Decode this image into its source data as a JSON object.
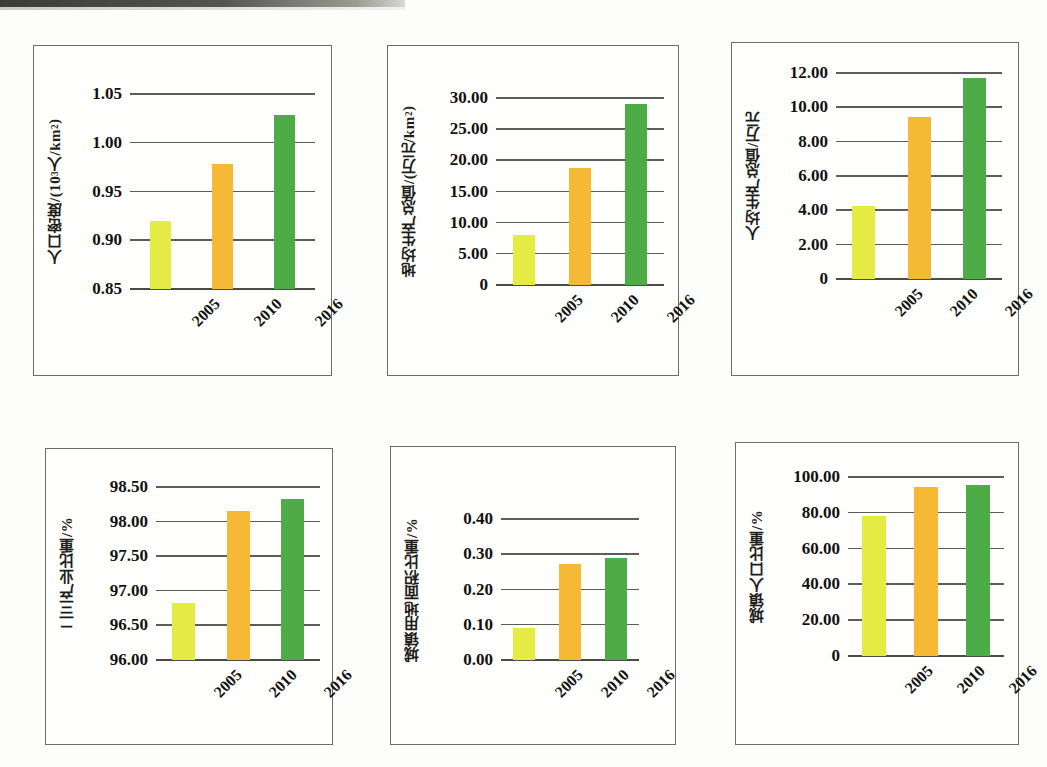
{
  "page": {
    "background_color": "#fdfdfb",
    "panel_border_color": "#6d6e60",
    "gridline_color": "#5d5d57",
    "series_colors": [
      "#e4ec44",
      "#f6b936",
      "#4dac46"
    ]
  },
  "charts": [
    {
      "id": "population-density",
      "chart_data": {
        "type": "bar",
        "title": "",
        "ylabel": "人口密度/(10³人/km²)",
        "ylabel_parts": {
          "pre": "人口密度/(10",
          "sup": "3",
          "post": "人/km",
          "sup2": "2",
          "tail": ")"
        },
        "xlabel": "",
        "categories": [
          "2005",
          "2010",
          "2016"
        ],
        "values": [
          0.92,
          0.978,
          1.028
        ],
        "ylim": [
          0.85,
          1.05
        ],
        "yticks": [
          0.85,
          0.9,
          0.95,
          1.0,
          1.05
        ],
        "ytick_labels": [
          "0.85",
          "0.90",
          "0.95",
          "1.00",
          "1.05"
        ],
        "grid": true,
        "legend": "none"
      }
    },
    {
      "id": "gdp-per-land-area",
      "chart_data": {
        "type": "bar",
        "title": "",
        "ylabel": "地均生产总值/(万元/km²)",
        "ylabel_parts": {
          "pre": "地均生产总值/(万元/km",
          "sup": "2",
          "post": ")"
        },
        "xlabel": "",
        "categories": [
          "2005",
          "2010",
          "2016"
        ],
        "values": [
          8.0,
          18.8,
          29.1
        ],
        "ylim": [
          0,
          30
        ],
        "yticks": [
          0,
          5,
          10,
          15,
          20,
          25,
          30
        ],
        "ytick_labels": [
          "0",
          "5.00",
          "10.00",
          "15.00",
          "20.00",
          "25.00",
          "30.00"
        ],
        "grid": true,
        "legend": "none"
      }
    },
    {
      "id": "gdp-per-capita",
      "chart_data": {
        "type": "bar",
        "title": "",
        "ylabel": "人均生产总值/万元",
        "xlabel": "",
        "categories": [
          "2005",
          "2010",
          "2016"
        ],
        "values": [
          4.25,
          9.45,
          11.7
        ],
        "ylim": [
          0,
          12
        ],
        "yticks": [
          0,
          2,
          4,
          6,
          8,
          10,
          12
        ],
        "ytick_labels": [
          "0",
          "2.00",
          "4.00",
          "6.00",
          "8.00",
          "10.00",
          "12.00"
        ],
        "grid": true,
        "legend": "none"
      }
    },
    {
      "id": "secondary-tertiary-industry-share",
      "chart_data": {
        "type": "bar",
        "title": "",
        "ylabel": "二三产业比重/%",
        "xlabel": "",
        "categories": [
          "2005",
          "2010",
          "2016"
        ],
        "values": [
          96.83,
          98.15,
          98.33
        ],
        "ylim": [
          96.0,
          98.5
        ],
        "yticks": [
          96.0,
          96.5,
          97.0,
          97.5,
          98.0,
          98.5
        ],
        "ytick_labels": [
          "96.00",
          "96.50",
          "97.00",
          "97.50",
          "98.00",
          "98.50"
        ],
        "grid": true,
        "legend": "none"
      }
    },
    {
      "id": "urban-land-area-share",
      "chart_data": {
        "type": "bar",
        "title": "",
        "ylabel": "城镇用地面积比重/%",
        "xlabel": "",
        "categories": [
          "2005",
          "2010",
          "2016"
        ],
        "values": [
          0.09,
          0.272,
          0.29
        ],
        "ylim": [
          0,
          0.4
        ],
        "yticks": [
          0,
          0.1,
          0.2,
          0.3,
          0.4
        ],
        "ytick_labels": [
          "0.00",
          "0.10",
          "0.20",
          "0.30",
          "0.40"
        ],
        "grid": true,
        "legend": "none"
      }
    },
    {
      "id": "urban-population-share",
      "chart_data": {
        "type": "bar",
        "title": "",
        "ylabel": "城镇人口比重/%",
        "xlabel": "",
        "categories": [
          "2005",
          "2010",
          "2016"
        ],
        "values": [
          78.5,
          94.5,
          95.5
        ],
        "ylim": [
          0,
          100
        ],
        "yticks": [
          0,
          20,
          40,
          60,
          80,
          100
        ],
        "ytick_labels": [
          "0",
          "20.00",
          "40.00",
          "60.00",
          "80.00",
          "100.00"
        ],
        "grid": true,
        "legend": "none"
      }
    }
  ]
}
